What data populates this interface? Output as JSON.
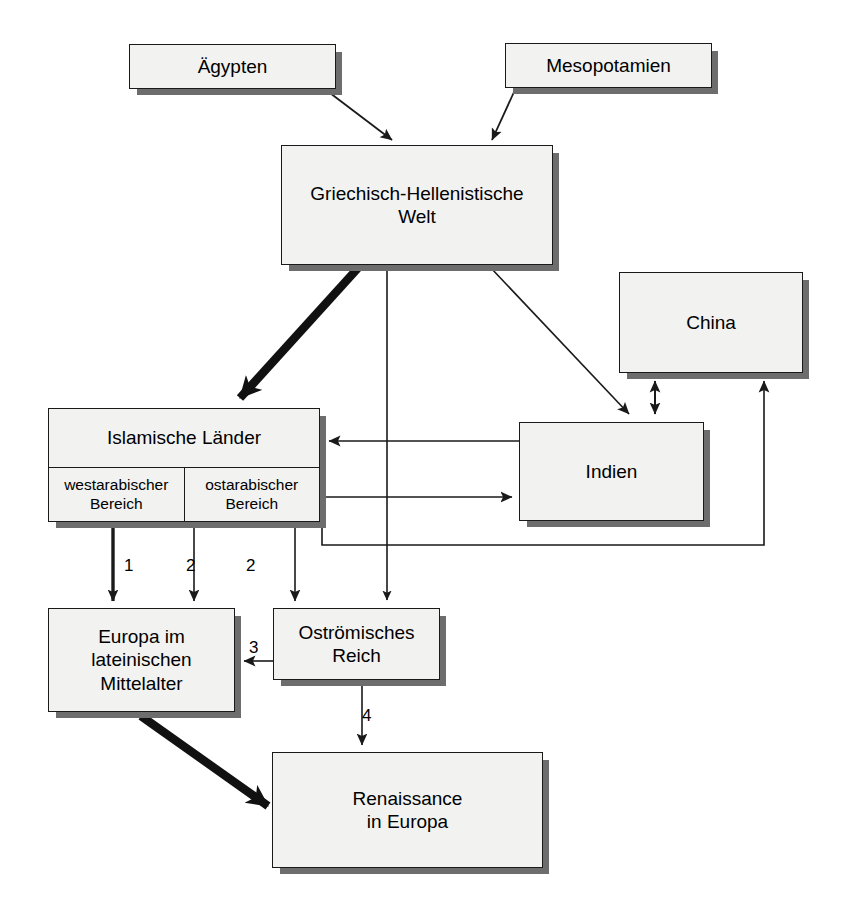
{
  "diagram": {
    "title_text": "",
    "colors": {
      "box_fill": "#f2f2f0",
      "box_border": "#1a1a1a",
      "box_shadow": "#6d6d6d",
      "line": "#1a1a1a",
      "background": "#ffffff"
    },
    "nodes": [
      {
        "id": "aegypten",
        "label": "Ägypten",
        "x": 129,
        "y": 44,
        "w": 207,
        "h": 45
      },
      {
        "id": "mesopotamien",
        "label": "Mesopotamien",
        "x": 505,
        "y": 43,
        "w": 207,
        "h": 45
      },
      {
        "id": "griechisch",
        "label": "Griechisch-Hellenistische\nWelt",
        "x": 281,
        "y": 145,
        "w": 272,
        "h": 120
      },
      {
        "id": "china",
        "label": "China",
        "x": 619,
        "y": 272,
        "w": 184,
        "h": 101
      },
      {
        "id": "indien",
        "label": "Indien",
        "x": 519,
        "y": 422,
        "w": 185,
        "h": 99
      },
      {
        "id": "europa",
        "label": "Europa im\nlateinischen\nMittelalter",
        "x": 48,
        "y": 608,
        "w": 187,
        "h": 104
      },
      {
        "id": "ostrom",
        "label": "Oströmisches\nReich",
        "x": 273,
        "y": 608,
        "w": 167,
        "h": 72
      },
      {
        "id": "renaissance",
        "label": "Renaissance\nin Europa",
        "x": 272,
        "y": 752,
        "w": 271,
        "h": 116
      }
    ],
    "split_node": {
      "id": "islamische",
      "title": "Islamische Länder",
      "cells": [
        "westarabischer\nBereich",
        "ostarabischer\nBereich"
      ],
      "x": 48,
      "y": 408,
      "w": 272,
      "h": 114
    },
    "edge_labels": [
      {
        "id": "edge-label-1",
        "text": "1",
        "x": 124,
        "y": 556
      },
      {
        "id": "edge-label-2a",
        "text": "2",
        "x": 186,
        "y": 556
      },
      {
        "id": "edge-label-2b",
        "text": "2",
        "x": 246,
        "y": 556
      },
      {
        "id": "edge-label-3",
        "text": "3",
        "x": 249,
        "y": 638
      },
      {
        "id": "edge-label-4",
        "text": "4",
        "x": 362,
        "y": 706
      }
    ],
    "edges": [
      {
        "id": "aegypten-to-griechisch",
        "from": "aegypten",
        "to": "griechisch",
        "weight": "thin"
      },
      {
        "id": "mesopotamien-to-griechisch",
        "from": "mesopotamien",
        "to": "griechisch",
        "weight": "thin"
      },
      {
        "id": "griechisch-to-islamische",
        "from": "griechisch",
        "to": "islamische",
        "weight": "thick"
      },
      {
        "id": "griechisch-to-ostrom",
        "from": "griechisch",
        "to": "ostrom",
        "weight": "thin"
      },
      {
        "id": "griechisch-to-indien",
        "from": "griechisch",
        "to": "indien",
        "weight": "thin"
      },
      {
        "id": "indien-to-islamische",
        "from": "indien",
        "to": "islamische",
        "weight": "thin"
      },
      {
        "id": "ostarabischer-to-indien",
        "from": "islamische",
        "to": "indien",
        "weight": "thin"
      },
      {
        "id": "islamische-to-china",
        "from": "islamische",
        "to": "china",
        "weight": "thin"
      },
      {
        "id": "indien-china-bidirectional",
        "from": "indien",
        "to": "china",
        "weight": "thin"
      },
      {
        "id": "westarabischer-to-europa",
        "from": "islamische",
        "to": "europa",
        "weight": "thick-line",
        "label": "1"
      },
      {
        "id": "ostarabischer-to-europa",
        "from": "islamische",
        "to": "europa",
        "weight": "thin",
        "label": "2"
      },
      {
        "id": "ostarabischer-to-ostrom",
        "from": "islamische",
        "to": "ostrom",
        "weight": "thin",
        "label": "2"
      },
      {
        "id": "ostrom-to-europa",
        "from": "ostrom",
        "to": "europa",
        "weight": "thin",
        "label": "3"
      },
      {
        "id": "ostrom-to-renaissance",
        "from": "ostrom",
        "to": "renaissance",
        "weight": "thin",
        "label": "4"
      },
      {
        "id": "europa-to-renaissance",
        "from": "europa",
        "to": "renaissance",
        "weight": "thick"
      }
    ]
  }
}
